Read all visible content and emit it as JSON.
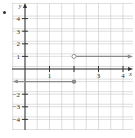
{
  "chart_data": {
    "type": "line",
    "title": "",
    "xlabel": "x",
    "ylabel": "y",
    "xlim": [
      -0.5,
      4.4
    ],
    "ylim": [
      -4.9,
      4.8
    ],
    "x_ticks": [
      1,
      2,
      3,
      4
    ],
    "x_tick_labels": [
      "1",
      "",
      "3",
      "4"
    ],
    "y_ticks": [
      -4,
      -3,
      -2,
      -1,
      1,
      2,
      3,
      4
    ],
    "y_tick_labels": [
      "−4",
      "−3",
      "−2",
      "−1",
      "1",
      "2",
      "3",
      "4"
    ],
    "grid": true,
    "grid_step": 0.5,
    "series": [
      {
        "name": "left piece",
        "x": [
          -0.5,
          2
        ],
        "y": [
          -1,
          -1
        ],
        "left_end": "arrow",
        "right_end": "closed-dot"
      },
      {
        "name": "right piece",
        "x": [
          2,
          4.4
        ],
        "y": [
          1,
          1
        ],
        "left_end": "open-dot",
        "right_end": "arrow"
      }
    ],
    "colors": {
      "axis": "#333333",
      "grid": "#c8c8c8",
      "line": "#8a8a8a",
      "point": "#8a8a8a"
    }
  }
}
